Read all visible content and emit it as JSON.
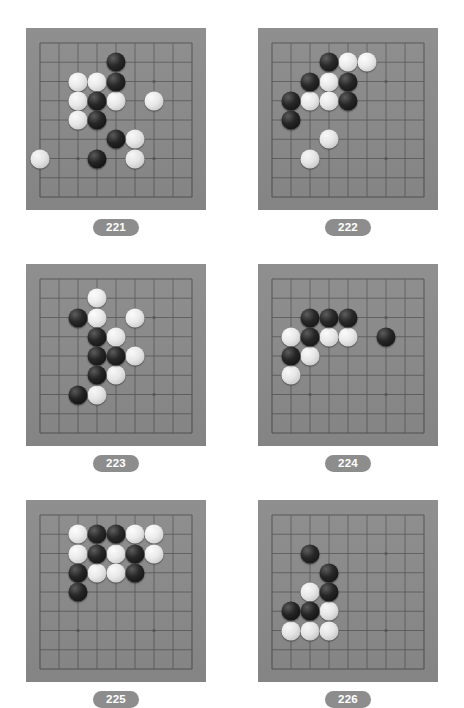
{
  "page": {
    "background_color": "#ffffff",
    "board_color": "#8b8b8b",
    "line_color": "#555555",
    "label_pill_color": "#8d8d8d",
    "label_text_color": "#ffffff"
  },
  "board_spec": {
    "columns": 9,
    "rows": 9,
    "star_points": [
      [
        6,
        2
      ],
      [
        6,
        6
      ],
      [
        2,
        6
      ]
    ],
    "note": "9x9 visible grid section; star points shown as small dots"
  },
  "diagrams": [
    {
      "label": "221",
      "black_stones": [
        [
          4,
          1
        ],
        [
          4,
          2
        ],
        [
          3,
          3
        ],
        [
          3,
          4
        ],
        [
          4,
          5
        ],
        [
          3,
          6
        ]
      ],
      "white_stones": [
        [
          2,
          2
        ],
        [
          3,
          2
        ],
        [
          2,
          3
        ],
        [
          4,
          3
        ],
        [
          6,
          3
        ],
        [
          2,
          4
        ],
        [
          5,
          5
        ],
        [
          0,
          6
        ],
        [
          5,
          6
        ]
      ]
    },
    {
      "label": "222",
      "black_stones": [
        [
          3,
          1
        ],
        [
          2,
          2
        ],
        [
          4,
          2
        ],
        [
          1,
          3
        ],
        [
          4,
          3
        ],
        [
          1,
          4
        ]
      ],
      "white_stones": [
        [
          4,
          1
        ],
        [
          5,
          1
        ],
        [
          3,
          2
        ],
        [
          2,
          3
        ],
        [
          3,
          3
        ],
        [
          3,
          5
        ],
        [
          2,
          6
        ]
      ]
    },
    {
      "label": "223",
      "black_stones": [
        [
          2,
          2
        ],
        [
          3,
          3
        ],
        [
          3,
          4
        ],
        [
          4,
          4
        ],
        [
          3,
          5
        ],
        [
          2,
          6
        ]
      ],
      "white_stones": [
        [
          3,
          1
        ],
        [
          3,
          2
        ],
        [
          5,
          2
        ],
        [
          4,
          3
        ],
        [
          5,
          4
        ],
        [
          4,
          5
        ],
        [
          3,
          6
        ]
      ]
    },
    {
      "label": "224",
      "black_stones": [
        [
          2,
          2
        ],
        [
          3,
          2
        ],
        [
          4,
          2
        ],
        [
          2,
          3
        ],
        [
          6,
          3
        ],
        [
          1,
          4
        ]
      ],
      "white_stones": [
        [
          1,
          3
        ],
        [
          3,
          3
        ],
        [
          4,
          3
        ],
        [
          2,
          4
        ],
        [
          1,
          5
        ]
      ]
    },
    {
      "label": "225",
      "black_stones": [
        [
          3,
          1
        ],
        [
          4,
          1
        ],
        [
          3,
          2
        ],
        [
          5,
          2
        ],
        [
          2,
          3
        ],
        [
          5,
          3
        ],
        [
          2,
          4
        ]
      ],
      "white_stones": [
        [
          2,
          1
        ],
        [
          5,
          1
        ],
        [
          6,
          1
        ],
        [
          2,
          2
        ],
        [
          4,
          2
        ],
        [
          6,
          2
        ],
        [
          3,
          3
        ],
        [
          4,
          3
        ]
      ]
    },
    {
      "label": "226",
      "black_stones": [
        [
          2,
          2
        ],
        [
          3,
          3
        ],
        [
          3,
          4
        ],
        [
          1,
          5
        ],
        [
          2,
          5
        ]
      ],
      "white_stones": [
        [
          2,
          4
        ],
        [
          3,
          5
        ],
        [
          1,
          6
        ],
        [
          2,
          6
        ],
        [
          3,
          6
        ]
      ]
    }
  ]
}
